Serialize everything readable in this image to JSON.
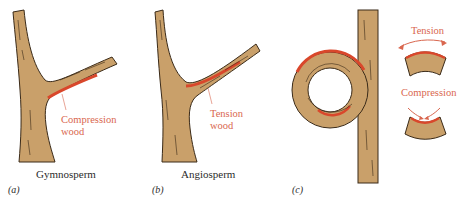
{
  "colors": {
    "wood": "#c9a06a",
    "outline": "#3a2a18",
    "reaction_wood": "#d9472b",
    "annotation_text": "#d9674f",
    "background": "#ffffff"
  },
  "panels": [
    {
      "letter": "(a)",
      "caption": "Gymnosperm",
      "annotation": {
        "line1": "Compression",
        "line2": "wood"
      }
    },
    {
      "letter": "(b)",
      "caption": "Angiosperm",
      "annotation": {
        "line1": "Tension",
        "line2": "wood"
      }
    },
    {
      "letter": "(c)",
      "caption": "",
      "annotation_top": "Tension",
      "annotation_bottom": "Compression"
    }
  ]
}
